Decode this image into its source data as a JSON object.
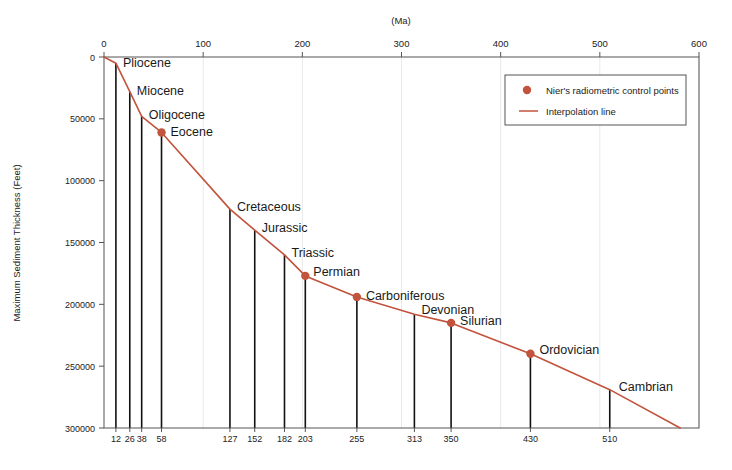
{
  "chart_data": {
    "type": "line",
    "title": "",
    "xlabel": "(Ma)",
    "ylabel": "Maximum Sediment Thickness (Feet)",
    "xlim": [
      0,
      600
    ],
    "ylim": [
      0,
      300000
    ],
    "y_inverted": true,
    "grid": true,
    "legend_position": "top-right",
    "x_ticks": [
      0,
      100,
      200,
      300,
      400,
      500,
      600
    ],
    "x_tick_labels": [
      "0",
      "100",
      "200",
      "300",
      "400",
      "500",
      "600"
    ],
    "y_ticks": [
      0,
      50000,
      100000,
      150000,
      200000,
      250000,
      300000
    ],
    "y_tick_labels": [
      "0",
      "50000",
      "100000",
      "150000",
      "200000",
      "250000",
      "300000"
    ],
    "secondary_x_ticks": [
      12,
      26,
      38,
      58,
      127,
      152,
      182,
      203,
      255,
      313,
      350,
      430,
      510
    ],
    "secondary_x_tick_labels": [
      "12",
      "26",
      "38",
      "58",
      "127",
      "152",
      "182",
      "203",
      "255",
      "313",
      "350",
      "430",
      "510"
    ],
    "categories": [
      "Pliocene",
      "Miocene",
      "Oligocene",
      "Eocene",
      "Cretaceous",
      "Jurassic",
      "Triassic",
      "Permian",
      "Carboniferous",
      "Devonian",
      "Silurian",
      "Ordovician",
      "Cambrian"
    ],
    "x": [
      12,
      26,
      38,
      58,
      127,
      152,
      182,
      203,
      255,
      313,
      350,
      430,
      510
    ],
    "values": [
      5000,
      28000,
      48000,
      61000,
      123000,
      140000,
      160000,
      177000,
      194000,
      208000,
      215000,
      240000,
      269000
    ],
    "series": [
      {
        "name": "Nier's radiometric control points",
        "x": [
          12,
          26,
          38,
          58,
          127,
          152,
          182,
          203,
          255,
          313,
          350,
          430,
          510
        ],
        "values": [
          5000,
          28000,
          48000,
          61000,
          123000,
          140000,
          160000,
          177000,
          194000,
          208000,
          215000,
          240000,
          269000
        ]
      },
      {
        "name": "Interpolation line",
        "x": [
          0,
          12,
          26,
          38,
          58,
          127,
          152,
          182,
          203,
          255,
          313,
          350,
          430,
          510,
          581
        ],
        "values": [
          0,
          5000,
          28000,
          48000,
          61000,
          123000,
          140000,
          160000,
          177000,
          194000,
          208000,
          215000,
          240000,
          269000,
          300000
        ]
      }
    ],
    "marker_points": [
      {
        "label": "Eocene",
        "x": 58,
        "y": 61000
      },
      {
        "label": "Permian",
        "x": 203,
        "y": 177000
      },
      {
        "label": "Carboniferous",
        "x": 255,
        "y": 194000
      },
      {
        "label": "Silurian",
        "x": 350,
        "y": 215000
      },
      {
        "label": "Ordovician",
        "x": 430,
        "y": 240000
      }
    ],
    "annotations": [
      {
        "text": "Pliocene",
        "x": 12,
        "y": 5000
      },
      {
        "text": "Miocene",
        "x": 26,
        "y": 28000
      },
      {
        "text": "Oligocene",
        "x": 38,
        "y": 48000
      },
      {
        "text": "Eocene",
        "x": 58,
        "y": 61000
      },
      {
        "text": "Cretaceous",
        "x": 127,
        "y": 123000
      },
      {
        "text": "Jurassic",
        "x": 152,
        "y": 140000
      },
      {
        "text": "Triassic",
        "x": 182,
        "y": 160000
      },
      {
        "text": "Permian",
        "x": 203,
        "y": 177000
      },
      {
        "text": "Carboniferous",
        "x": 255,
        "y": 194000
      },
      {
        "text": "Devonian",
        "x": 313,
        "y": 208000
      },
      {
        "text": "Silurian",
        "x": 350,
        "y": 215000
      },
      {
        "text": "Ordovician",
        "x": 430,
        "y": 240000
      },
      {
        "text": "Cambrian",
        "x": 510,
        "y": 269000
      }
    ],
    "colors": {
      "line": "#c2533c",
      "marker": "#c2533c",
      "stem": "#111111",
      "grid": "#e9e9e9",
      "frame": "#555555",
      "background": "#ffffff"
    }
  },
  "legend": {
    "items": [
      {
        "label": "Nier's radiometric control points",
        "marker": "dot",
        "color": "#c2533c"
      },
      {
        "label": "Interpolation line",
        "marker": "line",
        "color": "#c2533c"
      }
    ]
  },
  "axes": {
    "x_unit_label": "(Ma)",
    "y_axis_title": "Maximum Sediment Thickness (Feet)"
  }
}
